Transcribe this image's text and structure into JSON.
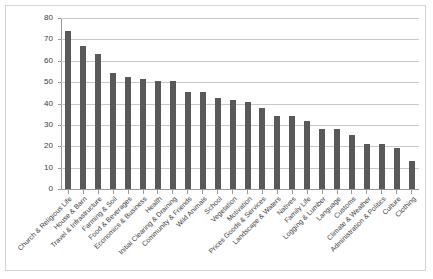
{
  "chart_data": {
    "type": "bar",
    "title": "",
    "subtitle": "",
    "xlabel": "",
    "ylabel": "",
    "ylim": [
      0,
      80
    ],
    "yticks": [
      0,
      10,
      20,
      30,
      40,
      50,
      60,
      70,
      80
    ],
    "grid": true,
    "legend": false,
    "legend_position": "none",
    "bar_color": "#595959",
    "gridline_color": "#c8c8c8",
    "axis_color": "#9a9a9a",
    "categories": [
      "Church & Religious Life",
      "House & Barn",
      "Travel & Infrastructure",
      "Farming & Soil",
      "Food  & Beverages",
      "Economics & Business",
      "Health",
      "Initial Clearing & Draining",
      "Community & Friends",
      "Wild Animals",
      "School",
      "Vegetation",
      "Motivation",
      "Prices Goods & Services",
      "Landscape & Waters",
      "Natives",
      "Family Life",
      "Logging & Lumber",
      "Language",
      "Customs",
      "Climate & Weather",
      "Administration & Politics",
      "Culture",
      "Clothing"
    ],
    "values": [
      74,
      67,
      63,
      54.5,
      52.5,
      51.5,
      50.5,
      50.5,
      45.5,
      45.5,
      42.5,
      41.5,
      40.5,
      38,
      34,
      34,
      32,
      28,
      28,
      25.5,
      21,
      21,
      19,
      13
    ]
  },
  "axis": {
    "y_tick_labels": [
      "80",
      "70",
      "60",
      "50",
      "40",
      "30",
      "20",
      "10",
      "0"
    ]
  }
}
